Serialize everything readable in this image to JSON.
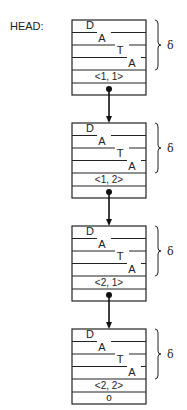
{
  "head_label": "HEAD:",
  "delta_symbol": "δ",
  "blocks": [
    {
      "data_letters": [
        "D",
        "A",
        "T",
        "A"
      ],
      "key": "<1, 1>",
      "next": "pointer"
    },
    {
      "data_letters": [
        "D",
        "A",
        "T",
        "A"
      ],
      "key": "<1, 2>",
      "next": "pointer"
    },
    {
      "data_letters": [
        "D",
        "A",
        "T",
        "A"
      ],
      "key": "<2, 1>",
      "next": "pointer"
    },
    {
      "data_letters": [
        "D",
        "A",
        "T",
        "A"
      ],
      "key": "<2, 2>",
      "next": "o"
    }
  ],
  "null_pointer_symbol": "o"
}
